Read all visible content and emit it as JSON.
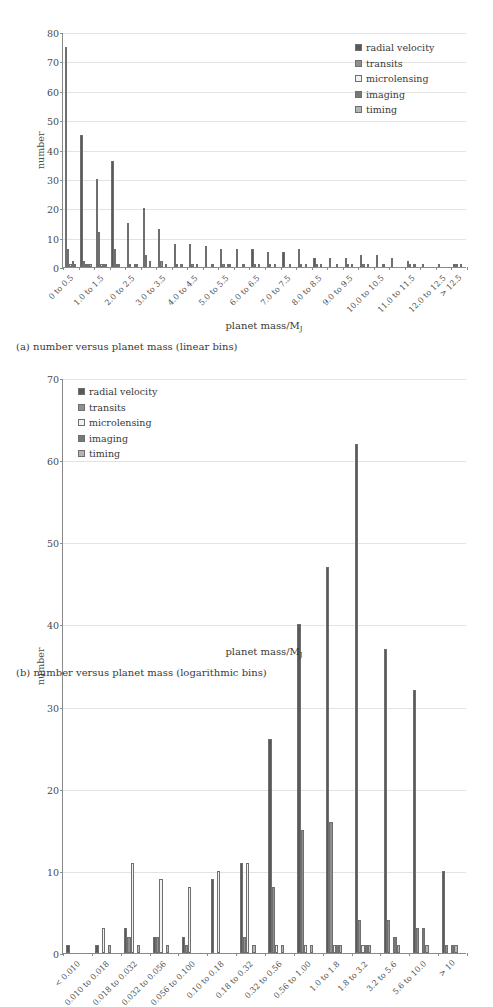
{
  "figure_a": {
    "caption": "(a) number versus planet mass (linear bins)",
    "xlabel_prefix": "planet mass/M",
    "xlabel_sub": "J",
    "ylabel": "number"
  },
  "figure_b": {
    "caption": "(b) number versus planet mass (logarithmic bins)",
    "xlabel_prefix": "planet mass/M",
    "xlabel_sub": "J",
    "ylabel": "number"
  },
  "colors": {
    "radial_velocity": "#595959",
    "transits": "#8f8f8f",
    "microlensing": "#f2f2f2",
    "imaging": "#787878",
    "timing": "#b5b5b5",
    "axis": "#8a8a8a",
    "grid": "#e3e3e3",
    "text": "#3a3a3a",
    "background": "#ffffff"
  },
  "legend_entries": [
    {
      "label": "radial velocity",
      "color": "#595959"
    },
    {
      "label": "transits",
      "color": "#8f8f8f"
    },
    {
      "label": "microlensing",
      "color": "#f2f2f2"
    },
    {
      "label": "imaging",
      "color": "#787878"
    },
    {
      "label": "timing",
      "color": "#b5b5b5"
    }
  ],
  "chart_data": [
    {
      "type": "bar",
      "id": "linear-bins",
      "title": "(a) number versus planet mass (linear bins)",
      "xlabel": "planet mass/M_J",
      "ylabel": "number",
      "ylim": [
        0,
        80
      ],
      "yticks": [
        0,
        10,
        20,
        30,
        40,
        50,
        60,
        70,
        80
      ],
      "grid": true,
      "legend_position": "top-right",
      "categories": [
        "0 to 0.5",
        "0.5 to 1.0",
        "1.0 to 1.5",
        "1.5 to 2.0",
        "2.0 to 2.5",
        "2.5 to 3.0",
        "3.0 to 3.5",
        "3.5 to 4.0",
        "4.0 to 4.5",
        "4.5 to 5.0",
        "5.0 to 5.5",
        "5.5 to 6.0",
        "6.0 to 6.5",
        "6.5 to 7.0",
        "7.0 to 7.5",
        "7.5 to 8.0",
        "8.0 to 8.5",
        "8.5 to 9.0",
        "9.0 to 9.5",
        "9.5 to 10.0",
        "10.0 to 10.5",
        "10.5 to 11.0",
        "11.0 to 11.5",
        "11.5 to 12.0",
        "12.0 to 12.5",
        "> 12.5"
      ],
      "category_tick_labels": [
        "0 to 0.5",
        "",
        "1.0 to 1.5",
        "",
        "2.0 to 2.5",
        "",
        "3.0 to 3.5",
        "",
        "4.0 to 4.5",
        "",
        "5.0 to 5.5",
        "",
        "6.0 to 6.5",
        "",
        "7.0 to 7.5",
        "",
        "8.0 to 8.5",
        "",
        "9.0 to 9.5",
        "",
        "10.0 to 10.5",
        "",
        "11.0 to 11.5",
        "",
        "12.0 to 12.5",
        "> 12.5"
      ],
      "series": [
        {
          "name": "radial velocity",
          "color": "#595959",
          "values": [
            75,
            45,
            30,
            36,
            15,
            20,
            13,
            8,
            8,
            7,
            6,
            6,
            6,
            5,
            5,
            6,
            3,
            3,
            3,
            4,
            4,
            3,
            2,
            1,
            1,
            1
          ]
        },
        {
          "name": "transits",
          "color": "#8f8f8f",
          "values": [
            6,
            2,
            12,
            6,
            1,
            4,
            2,
            1,
            1,
            0,
            1,
            0,
            1,
            1,
            0,
            1,
            1,
            0,
            1,
            1,
            0,
            0,
            1,
            0,
            0,
            1
          ]
        },
        {
          "name": "microlensing",
          "color": "#f2f2f2",
          "values": [
            1,
            1,
            1,
            1,
            0,
            0,
            0,
            0,
            0,
            0,
            0,
            0,
            0,
            0,
            0,
            0,
            0,
            0,
            0,
            0,
            0,
            0,
            0,
            0,
            0,
            0
          ]
        },
        {
          "name": "imaging",
          "color": "#787878",
          "values": [
            2,
            1,
            1,
            1,
            1,
            2,
            1,
            1,
            1,
            1,
            1,
            1,
            1,
            1,
            1,
            1,
            1,
            1,
            1,
            1,
            1,
            0,
            1,
            0,
            0,
            1
          ]
        },
        {
          "name": "timing",
          "color": "#b5b5b5",
          "values": [
            1,
            1,
            1,
            0,
            1,
            0,
            0,
            0,
            0,
            0,
            1,
            0,
            0,
            0,
            0,
            0,
            0,
            0,
            0,
            0,
            0,
            0,
            0,
            0,
            0,
            0
          ]
        }
      ]
    },
    {
      "type": "bar",
      "id": "log-bins",
      "title": "(b) number versus planet mass (logarithmic bins)",
      "xlabel": "planet mass/M_J",
      "ylabel": "number",
      "ylim": [
        0,
        70
      ],
      "yticks": [
        0,
        10,
        20,
        30,
        40,
        50,
        60,
        70
      ],
      "grid": true,
      "legend_position": "top-left",
      "categories": [
        "< 0.010",
        "0.010 to 0.018",
        "0.018 to 0.032",
        "0.032 to 0.056",
        "0.056 to 0.100",
        "0.10 to 0.18",
        "0.18 to 0.32",
        "0.32 to 0.56",
        "0.56 to 1.00",
        "1.0 to 1.8",
        "1.8 to 3.2",
        "3.2 to 5.6",
        "5.6 to 10.0",
        "> 10"
      ],
      "series": [
        {
          "name": "radial velocity",
          "color": "#595959",
          "values": [
            1,
            1,
            3,
            2,
            2,
            9,
            11,
            26,
            40,
            47,
            62,
            37,
            32,
            10
          ]
        },
        {
          "name": "transits",
          "color": "#8f8f8f",
          "values": [
            0,
            0,
            2,
            2,
            1,
            0,
            2,
            8,
            15,
            16,
            4,
            4,
            3,
            1
          ]
        },
        {
          "name": "microlensing",
          "color": "#f2f2f2",
          "values": [
            0,
            3,
            11,
            9,
            8,
            10,
            11,
            1,
            1,
            1,
            1,
            0,
            0,
            0
          ]
        },
        {
          "name": "imaging",
          "color": "#787878",
          "values": [
            0,
            0,
            0,
            0,
            0,
            0,
            0,
            0,
            0,
            1,
            1,
            2,
            3,
            1
          ]
        },
        {
          "name": "timing",
          "color": "#b5b5b5",
          "values": [
            0,
            1,
            1,
            1,
            0,
            0,
            1,
            1,
            1,
            1,
            1,
            1,
            1,
            1
          ]
        }
      ]
    }
  ]
}
